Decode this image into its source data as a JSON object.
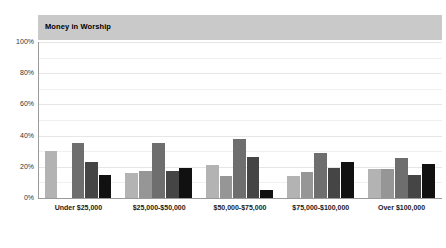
{
  "chart_data": {
    "type": "bar",
    "title": "Money in Worship",
    "xlabel": "",
    "ylabel": "",
    "ylim": [
      0,
      100
    ],
    "ytick_labels": [
      "100%",
      "80%",
      "60%",
      "40%",
      "20%",
      "0%"
    ],
    "ytick_values": [
      100,
      80,
      60,
      40,
      20,
      0
    ],
    "grid": true,
    "legend": "none",
    "categories": [
      "Under $25,000",
      "$25,000-$50,000",
      "$50,000-$75,000",
      "$75,000-$100,000",
      "Over $100,000"
    ],
    "series": [
      {
        "name": "Series 1",
        "color": "#b3b3b3",
        "values": [
          30,
          16,
          21,
          14,
          18.5
        ]
      },
      {
        "name": "Series 2",
        "color": "#969696",
        "values": [
          0,
          17.5,
          14,
          16.5,
          18.5
        ]
      },
      {
        "name": "Series 3",
        "color": "#6e6e6e",
        "values": [
          35,
          35.5,
          38,
          29,
          25.5
        ]
      },
      {
        "name": "Series 4",
        "color": "#454545",
        "values": [
          23,
          17.5,
          26,
          19.5,
          14.5
        ]
      },
      {
        "name": "Series 5",
        "color": "#111111",
        "values": [
          15,
          19.5,
          5,
          23,
          22
        ]
      }
    ]
  },
  "colors": {
    "title_band": "#c9c9c9",
    "gridline": "#e6e6e6",
    "axis": "#9a9a9a",
    "background": "#ffffff",
    "tick_text": "#333333",
    "category_text": "#1a1a1a"
  }
}
